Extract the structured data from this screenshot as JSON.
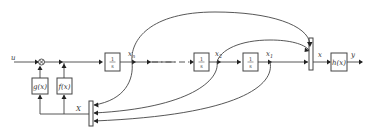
{
  "diagram": {
    "input_label": "u",
    "output_label": "y",
    "sum_symbol": "×",
    "blocks": {
      "g": "g(x)",
      "f": "f(x)",
      "h": "h(x)",
      "integrator_num": "1",
      "integrator_den": "s"
    },
    "signals": {
      "xn": "x",
      "xn_sub": "n",
      "x2": "x",
      "x2_sub": "2",
      "x1": "x",
      "x1_sub": "1",
      "x_mux_out": "x",
      "x_feedback": "X"
    },
    "ellipsis": "- · -"
  }
}
